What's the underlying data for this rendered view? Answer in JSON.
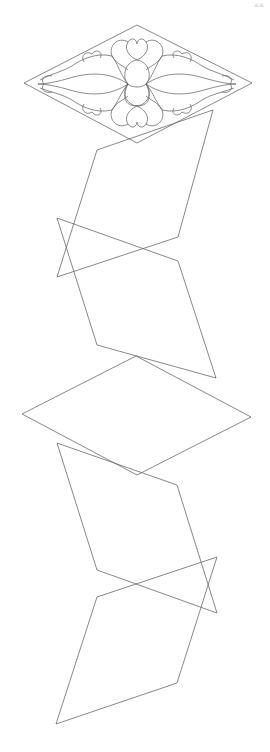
{
  "page": {
    "corner_mark": "≡≡"
  },
  "colors": {
    "background": "#ffffff",
    "stroke": "#6a6a6a"
  },
  "shapes": [
    {
      "name": "ornament-diamond",
      "points": "24,83 137,25 252,83 137,143"
    },
    {
      "name": "parallelogram-1",
      "points": "97,150 213,110 178,237 57,277"
    },
    {
      "name": "parallelogram-2",
      "points": "57,218 178,261 216,378 97,345"
    },
    {
      "name": "diamond-middle",
      "points": "22,414 136,356 251,417 137,475"
    },
    {
      "name": "parallelogram-3",
      "points": "57,443 177,485 217,613 97,570"
    },
    {
      "name": "parallelogram-4",
      "points": "97,597 217,557 177,683 56,724"
    }
  ]
}
